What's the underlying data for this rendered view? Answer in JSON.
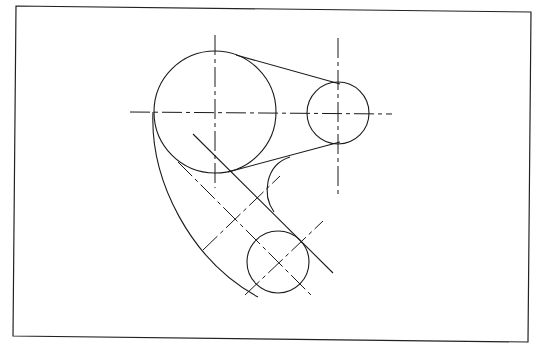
{
  "colors": {
    "background": "#ffffff",
    "line": "#1a1a1a"
  },
  "frame": {
    "points": [
      [
        16,
        6
      ],
      [
        531,
        12
      ],
      [
        528,
        342
      ],
      [
        13,
        336
      ]
    ]
  },
  "circles": [
    {
      "name": "large-boss",
      "cx": 215,
      "cy": 112,
      "r": 61
    },
    {
      "name": "small-boss-right",
      "cx": 338,
      "cy": 113,
      "r": 31
    },
    {
      "name": "small-boss-bottom",
      "cx": 278,
      "cy": 262,
      "r": 31
    }
  ],
  "centerlines": [
    {
      "name": "horizontal-main",
      "x1": 130,
      "y1": 112,
      "x2": 392,
      "y2": 114
    },
    {
      "name": "vertical-large",
      "x1": 215,
      "y1": 35,
      "x2": 215,
      "y2": 188
    },
    {
      "name": "vertical-right",
      "x1": 338,
      "y1": 38,
      "x2": 338,
      "y2": 196
    },
    {
      "name": "diagonal-arc-center",
      "x1": 178,
      "y1": 162,
      "x2": 311,
      "y2": 295
    },
    {
      "name": "diagonal-cross-mid",
      "x1": 203,
      "y1": 250,
      "x2": 280,
      "y2": 176
    },
    {
      "name": "diagonal-cross-bottom",
      "x1": 245,
      "y1": 295,
      "x2": 323,
      "y2": 221
    }
  ],
  "solid_lines": [
    {
      "name": "tangent-top",
      "x1": 236,
      "y1": 55,
      "x2": 340,
      "y2": 84
    },
    {
      "name": "tangent-bottom",
      "x1": 228,
      "y1": 172,
      "x2": 340,
      "y2": 142
    },
    {
      "name": "diagonal-edge",
      "x1": 193,
      "y1": 134,
      "x2": 333,
      "y2": 273
    }
  ],
  "arcs": [
    {
      "name": "outer-arc",
      "d": "M 153 112 C 150 180, 190 260, 258 297"
    },
    {
      "name": "inner-fillet",
      "d": "M 290 157 C 265 165, 262 195, 274 212"
    }
  ]
}
